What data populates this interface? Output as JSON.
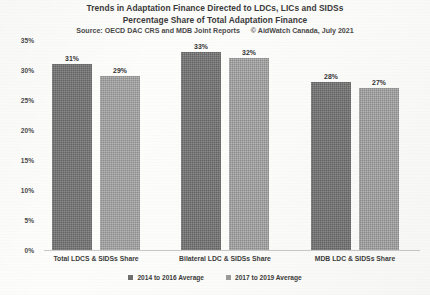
{
  "chart_data": {
    "type": "bar",
    "title": "Trends in Adaptation Finance Directed to LDCs, LICs and SIDSs",
    "subtitle": "Percentage Share of Total Adaptation Finance",
    "source": "Source:  OECD DAC CRS and MDB Joint Reports",
    "credit": "© AidWatch Canada, July 2021",
    "xlabel": "",
    "ylabel": "",
    "ylim": [
      0,
      35
    ],
    "grid": false,
    "legend_position": "bottom",
    "ytick_labels": [
      "35%",
      "30%",
      "25%",
      "20%",
      "15%",
      "10%",
      "5%",
      "0%"
    ],
    "ytick_values": [
      35,
      30,
      25,
      20,
      15,
      10,
      5,
      0
    ],
    "categories": [
      "Total LDCS & SIDSs Share",
      "Bilateral LDC & SIDSs Share",
      "MDB LDC & SIDSs Share"
    ],
    "series": [
      {
        "name": "2014 to 2016 Average",
        "color": "#6f6f6f",
        "values": [
          31,
          33,
          28
        ],
        "labels": [
          "31%",
          "33%",
          "28%"
        ]
      },
      {
        "name": "2017 to 2019 Average",
        "color": "#9c9c9c",
        "values": [
          29,
          32,
          27
        ],
        "labels": [
          "29%",
          "32%",
          "27%"
        ]
      }
    ]
  }
}
